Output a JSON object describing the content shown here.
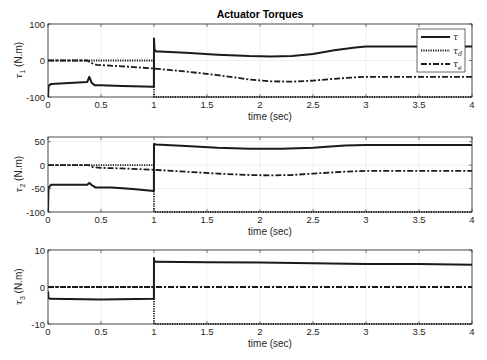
{
  "chart_data": [
    {
      "type": "line",
      "title": "Actuator Torques",
      "xlabel": "time (sec)",
      "ylabel_symbol": "τ",
      "ylabel_sub": "1",
      "ylabel_unit": "(N.m)",
      "xlim": [
        0,
        4
      ],
      "ylim": [
        -100,
        100
      ],
      "xticks": [
        0,
        0.5,
        1,
        1.5,
        2,
        2.5,
        3,
        3.5,
        4
      ],
      "xtick_labels": [
        "0",
        "0.5",
        "1",
        "1.5",
        "2",
        "2.5",
        "3",
        "3.5",
        "4"
      ],
      "yticks": [
        -100,
        0,
        100
      ],
      "ytick_labels": [
        "-100",
        "0",
        "100"
      ],
      "grid": true,
      "legend": {
        "placement": "top-right",
        "entries": [
          {
            "symbol": "τ",
            "sub": "",
            "style": "solid"
          },
          {
            "symbol": "τ",
            "sub": "d",
            "style": "dotted"
          },
          {
            "symbol": "τ",
            "sub": "e",
            "style": "dashdot"
          }
        ]
      },
      "series": [
        {
          "name": "τ",
          "style": "solid",
          "x": [
            0,
            0.005,
            0.03,
            0.2,
            0.37,
            0.39,
            0.41,
            0.44,
            0.5,
            0.7,
            0.999,
            1.0,
            1.005,
            1.02,
            1.05,
            1.3,
            1.6,
            1.9,
            2.1,
            2.3,
            2.5,
            2.7,
            2.9,
            3.0,
            3.5,
            4.0
          ],
          "y": [
            -100,
            -70,
            -64,
            -62,
            -59,
            -45,
            -60,
            -68,
            -68,
            -70,
            -72,
            60,
            30,
            25,
            25,
            21,
            16,
            12,
            11,
            12,
            18,
            28,
            36,
            38,
            38,
            38
          ]
        },
        {
          "name": "τ_d",
          "style": "dotted",
          "x": [
            0,
            0.999,
            1.0,
            4.0
          ],
          "y": [
            0,
            0,
            -100,
            -100
          ]
        },
        {
          "name": "τ_e",
          "style": "dashdot",
          "x": [
            0,
            0.37,
            0.42,
            0.46,
            0.7,
            1.0,
            1.3,
            1.6,
            1.9,
            2.1,
            2.3,
            2.5,
            2.7,
            2.9,
            3.0,
            3.5,
            4.0
          ],
          "y": [
            0,
            0,
            -8,
            -12,
            -16,
            -22,
            -30,
            -40,
            -52,
            -57,
            -58,
            -55,
            -50,
            -46,
            -45,
            -45,
            -45
          ]
        }
      ]
    },
    {
      "type": "line",
      "title": "",
      "xlabel": "time (sec)",
      "ylabel_symbol": "τ",
      "ylabel_sub": "2",
      "ylabel_unit": "(N.m)",
      "xlim": [
        0,
        4
      ],
      "ylim": [
        -100,
        60
      ],
      "xticks": [
        0,
        0.5,
        1,
        1.5,
        2,
        2.5,
        3,
        3.5,
        4
      ],
      "xtick_labels": [
        "0",
        "0.5",
        "1",
        "1.5",
        "2",
        "2.5",
        "3",
        "3.5",
        "4"
      ],
      "yticks": [
        -100,
        -50,
        0,
        50
      ],
      "ytick_labels": [
        "-100",
        "-50",
        "0",
        "50"
      ],
      "grid": true,
      "series": [
        {
          "name": "τ",
          "style": "solid",
          "x": [
            0,
            0.005,
            0.03,
            0.2,
            0.37,
            0.39,
            0.41,
            0.45,
            0.6,
            0.8,
            0.999,
            1.0,
            1.02,
            1.3,
            1.6,
            1.9,
            2.2,
            2.5,
            2.8,
            3.0,
            3.5,
            4.0
          ],
          "y": [
            -100,
            -48,
            -42,
            -42,
            -42,
            -38,
            -42,
            -48,
            -48,
            -51,
            -55,
            45,
            44,
            41,
            37,
            35,
            35,
            37,
            42,
            43,
            43,
            43
          ]
        },
        {
          "name": "τ_d",
          "style": "dotted",
          "x": [
            0,
            0.999,
            1.0,
            4.0
          ],
          "y": [
            0,
            0,
            -100,
            -100
          ]
        },
        {
          "name": "τ_e",
          "style": "dashdot",
          "x": [
            0,
            0.38,
            0.42,
            0.5,
            0.7,
            1.0,
            1.3,
            1.6,
            1.9,
            2.1,
            2.3,
            2.5,
            2.8,
            3.0,
            3.5,
            4.0
          ],
          "y": [
            0,
            0,
            -4,
            -6,
            -7,
            -10,
            -14,
            -18,
            -21,
            -22,
            -21,
            -18,
            -14,
            -12,
            -12,
            -12
          ]
        }
      ]
    },
    {
      "type": "line",
      "title": "",
      "xlabel": "time (sec)",
      "ylabel_symbol": "τ",
      "ylabel_sub": "3",
      "ylabel_unit": "(N.m)",
      "xlim": [
        0,
        4
      ],
      "ylim": [
        -10,
        10
      ],
      "xticks": [
        0,
        0.5,
        1,
        1.5,
        2,
        2.5,
        3,
        3.5,
        4
      ],
      "xtick_labels": [
        "0",
        "0.5",
        "1",
        "1.5",
        "2",
        "2.5",
        "3",
        "3.5",
        "4"
      ],
      "yticks": [
        -10,
        0,
        10
      ],
      "ytick_labels": [
        "-10",
        "0",
        "10"
      ],
      "grid": true,
      "series": [
        {
          "name": "τ",
          "style": "solid",
          "x": [
            0,
            0.005,
            0.02,
            0.5,
            0.999,
            1.0,
            1.003,
            1.02,
            1.5,
            2.0,
            2.5,
            3.0,
            3.5,
            4.0
          ],
          "y": [
            -1.2,
            -3.0,
            -3.2,
            -3.4,
            -3.2,
            7.8,
            6.8,
            6.8,
            6.7,
            6.6,
            6.4,
            6.2,
            6.2,
            6.0
          ]
        },
        {
          "name": "τ_d",
          "style": "dotted",
          "x": [
            0,
            0.999,
            1.0,
            4.0
          ],
          "y": [
            0,
            0,
            -10,
            -10
          ]
        },
        {
          "name": "τ_e",
          "style": "dashdot",
          "x": [
            0,
            4.0
          ],
          "y": [
            0,
            0
          ]
        }
      ]
    }
  ]
}
